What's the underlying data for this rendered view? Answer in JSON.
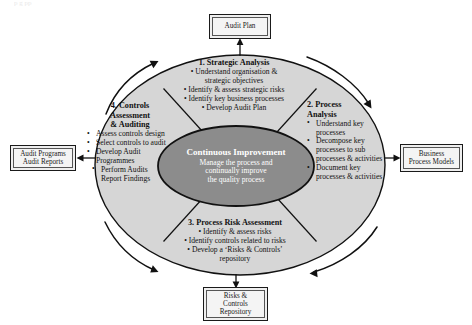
{
  "diagram": {
    "hub": {
      "title_line1": "Continuous",
      "title_line2": "Improvement",
      "sub_line1": "Manage the process and",
      "sub_line2": "continually improve",
      "sub_line3": "the quality process"
    },
    "quadrants": [
      {
        "id": "strategic-analysis",
        "title": "1. Strategic Analysis",
        "bullets": [
          "Understand organisation &",
          "strategic objectives",
          "Identify & assess strategic risks",
          "Identify key business processes",
          "Develop Audit Plan"
        ]
      },
      {
        "id": "process-analysis",
        "title_line1": "2. Process",
        "title_line2": "Analysis",
        "bullets": [
          "Understand key processes",
          "Decompose key processes to sub processes & activities",
          "Document key processes & activities"
        ]
      },
      {
        "id": "process-risk-assessment",
        "title": "3. Process Risk Assessment",
        "bullets": [
          "Identify & assess risks",
          "Identify controls related to risks",
          "Develop a ‘Risks & Controls’",
          "repository"
        ]
      },
      {
        "id": "controls-assessment-auditing",
        "title_line1": "4. Controls",
        "title_line2": "Assessment",
        "title_line3": "& Auditing",
        "bullets": [
          "Assess controls design",
          "Select controls to audit",
          "Develop Audit Programmes",
          "Perform Audits",
          "Report Findings"
        ]
      }
    ],
    "boxes": {
      "audit_plan": {
        "lines": [
          "Audit Plan"
        ]
      },
      "audit_programs_reports": {
        "lines": [
          "Audit Programs",
          "Audit Reports"
        ]
      },
      "business_process_models": {
        "lines": [
          "Business",
          "Process Models"
        ]
      },
      "risks_controls_repository": {
        "lines": [
          "Risks &",
          "Controls",
          "Repository"
        ]
      }
    },
    "bullet_glyph": "•",
    "colors": {
      "outer_ring_fill": "#d6d6d6",
      "hub_fill": "#8c8c8c",
      "stroke": "#111111",
      "box_fill": "#f1f1f1",
      "page_background": "#ffffff"
    },
    "clipped_header_text": "p                 g     pp"
  }
}
